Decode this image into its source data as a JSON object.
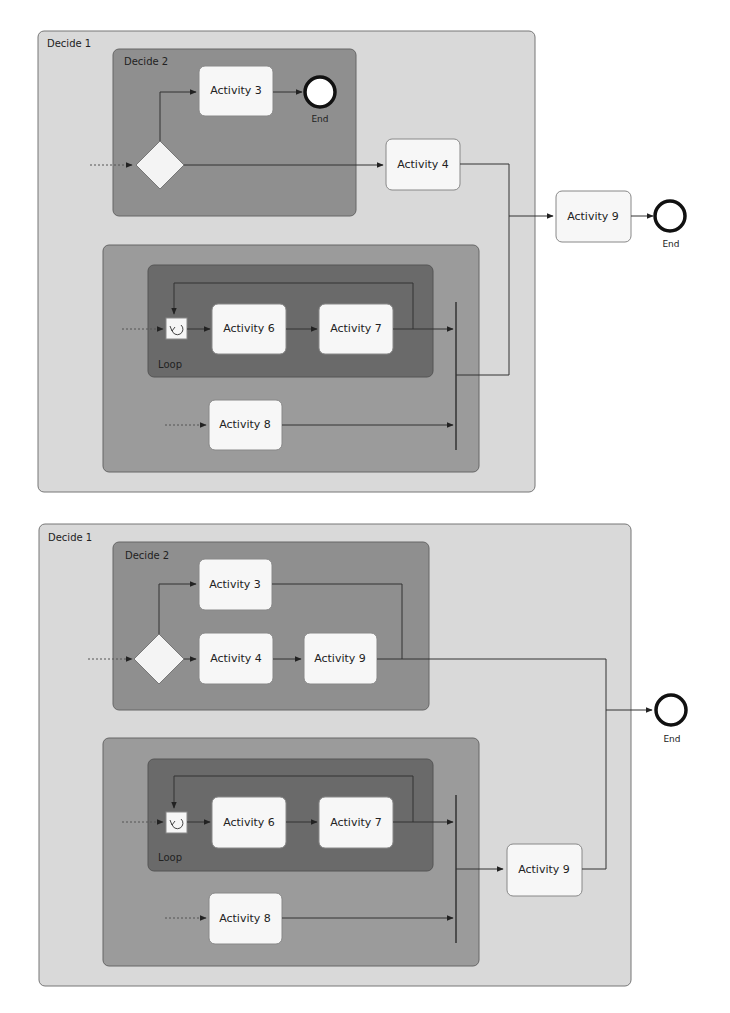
{
  "diagrams": [
    {
      "outer_label": "Decide 1",
      "decide2_label": "Decide 2",
      "loop_label": "Loop",
      "activities": {
        "a3": "Activity 3",
        "a4": "Activity 4",
        "a6": "Activity 6",
        "a7": "Activity 7",
        "a8": "Activity 8",
        "a9": "Activity 9"
      },
      "end_inner": "End",
      "end_outer": "End"
    },
    {
      "outer_label": "Decide 1",
      "decide2_label": "Decide 2",
      "loop_label": "Loop",
      "activities": {
        "a3": "Activity 3",
        "a4": "Activity 4",
        "a9_inner": "Activity 9",
        "a6": "Activity 6",
        "a7": "Activity 7",
        "a8": "Activity 8",
        "a9_outer": "Activity 9"
      },
      "end_outer": "End"
    }
  ],
  "colors": {
    "outer_fill": "#d9d9d9",
    "decide2_fill": "#8f8f8f",
    "parallel_fill": "#9b9b9b",
    "loop_fill": "#6a6a6a",
    "activity_fill": "#f7f7f7",
    "line": "#333333"
  }
}
